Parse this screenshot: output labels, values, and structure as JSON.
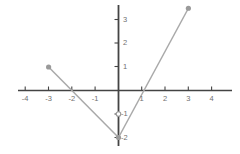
{
  "figure": {
    "width": 240,
    "height": 154,
    "background_color": "#ffffff",
    "axis_color": "#444444",
    "curve_color": "#a9a9a9",
    "point_color": "#9a9a9a",
    "label_color": "#6f6f6f"
  },
  "chart_data": {
    "type": "line",
    "title": "",
    "xlabel": "",
    "ylabel": "",
    "xlim": [
      -4.3,
      4.9
    ],
    "ylim": [
      -2.4,
      3.6
    ],
    "grid": false,
    "legend": null,
    "axes": {
      "x_ticks": [
        -4,
        -3,
        -2,
        -1,
        1,
        2,
        3,
        4
      ],
      "x_tick_labels": [
        "-4",
        "-3",
        "-2",
        "-1",
        "1",
        "2",
        "3",
        "4"
      ],
      "y_ticks": [
        3,
        2,
        1,
        -1,
        -2
      ],
      "y_tick_labels": [
        "3",
        "2",
        "1",
        "-1",
        "-2"
      ],
      "origin_label": ""
    },
    "series": [
      {
        "name": "descending-branch",
        "type": "segment",
        "points": [
          [
            -3,
            1
          ],
          [
            -2,
            0
          ],
          [
            0,
            -2
          ]
        ],
        "slope": -1,
        "endpoints": [
          {
            "x": -3,
            "y": 1,
            "marker": "closed-dot"
          },
          {
            "x": 0,
            "y": -2,
            "marker": "closed-dot"
          }
        ],
        "x_intercept": -2
      },
      {
        "name": "ascending-branch",
        "type": "segment",
        "points": [
          [
            0,
            -2
          ],
          [
            0.4,
            0
          ],
          [
            3,
            3.5
          ]
        ],
        "slope": 1.83,
        "endpoints": [
          {
            "x": 0,
            "y": -2,
            "marker": "closed-dot"
          },
          {
            "x": 3,
            "y": 3.5,
            "marker": "closed-dot"
          }
        ],
        "x_intercept": 0.4,
        "y_axis_marker": {
          "x": 0,
          "y": -1,
          "marker": "open-dot"
        }
      }
    ]
  }
}
